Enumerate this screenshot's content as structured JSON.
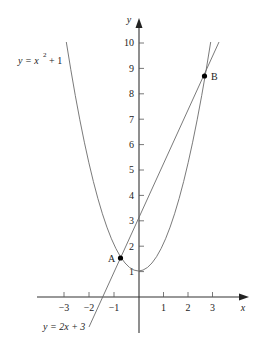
{
  "diagram": {
    "axes": {
      "x_label": "x",
      "y_label": "y",
      "x_ticks": [
        "−3",
        "−2",
        "−1",
        "1",
        "2",
        "3"
      ],
      "y_ticks": [
        "1",
        "2",
        "3",
        "4",
        "5",
        "6",
        "7",
        "8",
        "9",
        "10"
      ]
    },
    "curves": {
      "parabola_label": "y = x",
      "parabola_exp": "2",
      "parabola_tail": "+ 1",
      "line_label": "y = 2x + 3"
    },
    "points": {
      "A": "A",
      "B": "B"
    },
    "colors": {
      "curve": "#6b6b6b",
      "axis": "#333333",
      "point": "#000000"
    }
  }
}
